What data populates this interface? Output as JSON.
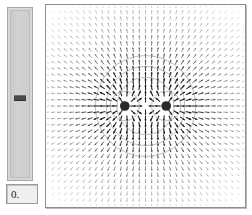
{
  "window": {
    "background_color": "#ffffff"
  },
  "control_panel": {
    "name": "parameter-slider-panel",
    "slider": {
      "label": "",
      "orientation": "vertical",
      "value": 0,
      "min": -1,
      "max": 1,
      "thumb_position_fraction": 0.5,
      "track_color": "#cdcdcd",
      "thumb_color": "#4a4a4a"
    },
    "value_field": {
      "value": "0.",
      "placeholder": "0.",
      "background_color": "#efefef"
    }
  },
  "plot_panel": {
    "frame_color": "#8e8e8e",
    "background_color": "#ffffff"
  },
  "chart_data": {
    "type": "scatter",
    "subtype": "vector-field",
    "title": "",
    "subtitle": "",
    "xlabel": "",
    "ylabel": "",
    "xlim": [
      -2,
      2
    ],
    "ylim": [
      -2,
      2
    ],
    "grid": false,
    "legend": null,
    "axis_ticks_visible": false,
    "arrow_color_weak": "#f0f0f0",
    "arrow_color_strong": "#1c1c1c",
    "contour_color": "#9a9a9a",
    "charge_marker_color": "#2a2a2a",
    "charges": [
      {
        "name": "charge-left",
        "x": -0.42,
        "y": 0.0,
        "sign": "+",
        "radius": 0.12
      },
      {
        "name": "charge-right",
        "x": 0.42,
        "y": 0.0,
        "sign": "+",
        "radius": 0.12
      }
    ],
    "contours": [
      {
        "cx": 0.0,
        "cy": 0.0,
        "r": 1.02
      },
      {
        "cx": 0.0,
        "cy": 0.0,
        "r": 0.8
      },
      {
        "cx": 0.0,
        "cy": 0.0,
        "r": 0.58
      },
      {
        "cx": -0.42,
        "cy": 0.0,
        "r": 0.3
      },
      {
        "cx": 0.42,
        "cy": 0.0,
        "r": 0.3
      }
    ],
    "field_grid": {
      "nx": 33,
      "ny": 33,
      "arrow_scale": 0.95
    }
  }
}
